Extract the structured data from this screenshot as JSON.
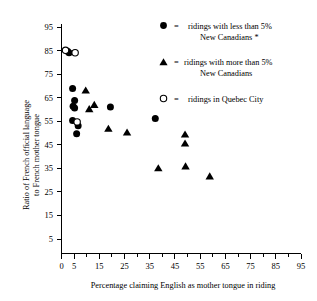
{
  "chart_data": {
    "type": "scatter",
    "title": "",
    "xlabel": "Percentage claiming English as mother tongue in riding",
    "ylabel": "Ratio of French official language to French mother tongue",
    "xlim": [
      0,
      95
    ],
    "ylim": [
      0,
      95
    ],
    "xticks": [
      0,
      5,
      15,
      25,
      35,
      45,
      55,
      65,
      75,
      85,
      95
    ],
    "xticklabels": [
      "0",
      "5",
      "15",
      "25",
      "35",
      "45",
      "55",
      "65",
      "75",
      "85",
      "95"
    ],
    "xminorticks": [
      10,
      20,
      30,
      40,
      50,
      60,
      70,
      80,
      90
    ],
    "yticks": [
      5,
      15,
      25,
      35,
      45,
      55,
      65,
      75,
      85,
      95
    ],
    "yticklabels": [
      "5",
      "15",
      "25",
      "35",
      "45",
      "55",
      "65",
      "75",
      "85",
      "95"
    ],
    "grid": false,
    "legend_position": "upper right",
    "series": [
      {
        "name": "ridings with less than 5% New Canadians *",
        "marker": "filled-circle",
        "color": "#000000",
        "points": [
          [
            2.4,
            84.8
          ],
          [
            3.0,
            84.2
          ],
          [
            4.4,
            69.2
          ],
          [
            5.2,
            64.2
          ],
          [
            4.6,
            61.8
          ],
          [
            5.2,
            61.0
          ],
          [
            4.4,
            55.8
          ],
          [
            6.6,
            53.6
          ],
          [
            6.0,
            50.2
          ],
          [
            19.4,
            61.4
          ],
          [
            37.2,
            56.6
          ]
        ]
      },
      {
        "name": "ridings with more than 5% New Canadians",
        "marker": "filled-triangle",
        "color": "#000000",
        "points": [
          [
            9.6,
            68.4
          ],
          [
            11.0,
            60.6
          ],
          [
            13.0,
            62.4
          ],
          [
            18.6,
            52.4
          ],
          [
            26.0,
            50.8
          ],
          [
            38.4,
            35.8
          ],
          [
            49.0,
            50.0
          ],
          [
            49.0,
            46.2
          ],
          [
            49.2,
            36.6
          ],
          [
            58.8,
            32.4
          ]
        ]
      },
      {
        "name": "ridings in Quebec City",
        "marker": "open-circle",
        "color": "#000000",
        "points": [
          [
            1.6,
            85.2
          ],
          [
            5.4,
            84.2
          ],
          [
            6.2,
            55.2
          ]
        ]
      }
    ]
  },
  "legend": {
    "equals": "=",
    "entries": [
      {
        "marker": "filled-circle",
        "line1": "ridings with less than 5%",
        "line2": "New Canadians *"
      },
      {
        "marker": "filled-triangle",
        "line1": "ridings with more than 5%",
        "line2": "New Canadians"
      },
      {
        "marker": "open-circle",
        "line1": "ridings in Quebec City",
        "line2": ""
      }
    ]
  },
  "ylabel_lines": [
    "Ratio of French official language",
    "to French mother tongue"
  ]
}
